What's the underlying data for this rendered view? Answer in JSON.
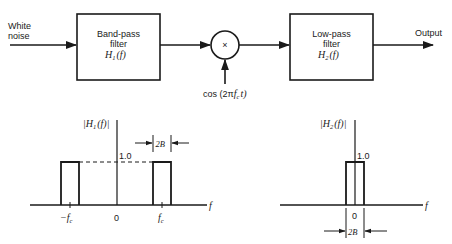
{
  "block_diagram": {
    "input_label_line1": "White",
    "input_label_line2": "noise",
    "bandpass": {
      "line1": "Band-pass",
      "line2": "filter",
      "func": "H",
      "sub": "1",
      "arg": "(f)"
    },
    "mixer_symbol": "×",
    "oscillator_label_pre": "cos (2π",
    "oscillator_f": "f",
    "oscillator_sub": "c",
    "oscillator_post": "t)",
    "lowpass": {
      "line1": "Low-pass",
      "line2": "filter",
      "func": "H",
      "sub": "2",
      "arg": "(f)"
    },
    "output_label": "Output"
  },
  "plots": {
    "h1": {
      "ylabel_func": "|H",
      "ylabel_sub": "1",
      "ylabel_arg": "(f)|",
      "level_label": "1.0",
      "bandwidth_label": "2B",
      "x_axis_label": "f",
      "ticks": {
        "neg": "−f",
        "neg_sub": "c",
        "zero": "0",
        "pos": "f",
        "pos_sub": "c"
      }
    },
    "h2": {
      "ylabel_func": "|H",
      "ylabel_sub": "2",
      "ylabel_arg": "(f)|",
      "level_label": "1.0",
      "bandwidth_label": "2B",
      "x_axis_label": "f",
      "ticks": {
        "zero": "0"
      }
    }
  },
  "colors": {
    "ink": "#1a1a1a",
    "background": "#ffffff"
  }
}
